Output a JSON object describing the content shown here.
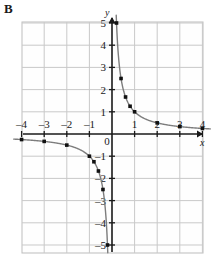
{
  "panel": {
    "label": "B"
  },
  "chart_data": {
    "type": "line",
    "title": "",
    "subtitle": "",
    "xlabel": "x",
    "ylabel": "y",
    "xlim": [
      -4.35,
      4.35
    ],
    "ylim": [
      -5.35,
      5.35
    ],
    "grid": true,
    "legend": null,
    "legend_position": "none",
    "x_ticks": [
      -4,
      -3,
      -2,
      -1,
      0,
      1,
      2,
      3,
      4
    ],
    "x_tick_labels": [
      "-4",
      "-3",
      "-2",
      "-1",
      "0",
      "1",
      "2",
      "3",
      "4"
    ],
    "y_ticks": [
      5,
      4,
      3,
      2,
      1,
      -1,
      -2,
      -3,
      -4,
      -5
    ],
    "y_tick_labels": [
      "5",
      "4",
      "3",
      "2",
      "1",
      "-1",
      "-2",
      "-3",
      "-4",
      "-5"
    ],
    "origin_label": "0",
    "curve_color": "#7d7d7d",
    "marker_color": "#111111",
    "grid_color": "#c9c9c9",
    "axis_color": "#1a1a1a",
    "series": [
      {
        "name": "y = 1/x (branch x > 0)",
        "marker_points": [
          {
            "x": 0.2,
            "y": 5
          },
          {
            "x": 0.4,
            "y": 2.5
          },
          {
            "x": 0.6,
            "y": 1.667
          },
          {
            "x": 0.8,
            "y": 1.25
          },
          {
            "x": 1,
            "y": 1
          },
          {
            "x": 2,
            "y": 0.5
          },
          {
            "x": 3,
            "y": 0.333
          },
          {
            "x": 4,
            "y": 0.25
          }
        ]
      },
      {
        "name": "y = 1/x (branch x < 0)",
        "marker_points": [
          {
            "x": -4,
            "y": -0.25
          },
          {
            "x": -3,
            "y": -0.333
          },
          {
            "x": -2,
            "y": -0.5
          },
          {
            "x": -1,
            "y": -1
          },
          {
            "x": -0.8,
            "y": -1.25
          },
          {
            "x": -0.6,
            "y": -1.667
          },
          {
            "x": -0.4,
            "y": -2.5
          },
          {
            "x": -0.2,
            "y": -5
          }
        ]
      }
    ]
  }
}
